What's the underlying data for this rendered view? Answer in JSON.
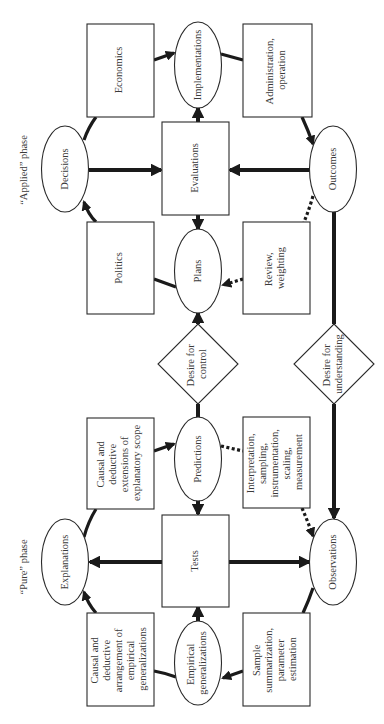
{
  "diagram": {
    "orientation": "rotated 90 degrees counter-clockwise",
    "phases": {
      "applied": "“Applied” phase",
      "pure": "“Pure” phase"
    },
    "nodes": {
      "decisions": {
        "shape": "ellipse",
        "lines": [
          "Decisions"
        ]
      },
      "economics": {
        "shape": "rect",
        "lines": [
          "Economics"
        ]
      },
      "implementations": {
        "shape": "ellipse",
        "lines": [
          "Implementations"
        ]
      },
      "administration": {
        "shape": "rect",
        "lines": [
          "Administration,",
          "operation"
        ]
      },
      "evaluations": {
        "shape": "rect",
        "lines": [
          "Evaluations"
        ]
      },
      "outcomes": {
        "shape": "ellipse",
        "lines": [
          "Outcomes"
        ]
      },
      "politics": {
        "shape": "rect",
        "lines": [
          "Politics"
        ]
      },
      "plans": {
        "shape": "ellipse",
        "lines": [
          "Plans"
        ]
      },
      "review": {
        "shape": "rect",
        "lines": [
          "Review,",
          "weighting"
        ]
      },
      "desire_control": {
        "shape": "diamond",
        "lines": [
          "Desire for",
          "control"
        ]
      },
      "desire_understanding": {
        "shape": "diamond",
        "lines": [
          "Desire for",
          "understanding"
        ]
      },
      "extensions": {
        "shape": "rect",
        "lines": [
          "Causal and",
          "deductive",
          "extensions of",
          "explanatory scope"
        ]
      },
      "predictions": {
        "shape": "ellipse",
        "lines": [
          "Predictions"
        ]
      },
      "interpretation": {
        "shape": "rect",
        "lines": [
          "Interpretation,",
          "sampling,",
          "instrumentation,",
          "scaling,",
          "measurement"
        ]
      },
      "explanations": {
        "shape": "ellipse",
        "lines": [
          "Explanations"
        ]
      },
      "tests": {
        "shape": "rect",
        "lines": [
          "Tests"
        ]
      },
      "observations": {
        "shape": "ellipse",
        "lines": [
          "Observations"
        ]
      },
      "arrangement": {
        "shape": "rect",
        "lines": [
          "Causal and",
          "deductive",
          "arrangement of",
          "empirical",
          "generalizations"
        ]
      },
      "empirical": {
        "shape": "ellipse",
        "lines": [
          "Empirical",
          "generalizations"
        ]
      },
      "sample": {
        "shape": "rect",
        "lines": [
          "Sample",
          "summarization,",
          "parameter",
          "estimation"
        ]
      }
    },
    "edges": [
      {
        "from": "politics",
        "to": "decisions",
        "style": "solid"
      },
      {
        "from": "decisions",
        "to": "economics",
        "style": "solid"
      },
      {
        "from": "economics",
        "to": "implementations",
        "style": "solid"
      },
      {
        "from": "implementations",
        "to": "administration",
        "style": "solid"
      },
      {
        "from": "administration",
        "to": "outcomes",
        "style": "solid"
      },
      {
        "from": "decisions",
        "to": "evaluations",
        "style": "solid"
      },
      {
        "from": "outcomes",
        "to": "evaluations",
        "style": "solid"
      },
      {
        "from": "evaluations",
        "to": "implementations",
        "style": "solid"
      },
      {
        "from": "evaluations",
        "to": "plans",
        "style": "solid"
      },
      {
        "from": "plans",
        "to": "politics",
        "style": "solid"
      },
      {
        "from": "outcomes",
        "to": "review",
        "style": "dashed"
      },
      {
        "from": "review",
        "to": "plans",
        "style": "dashed"
      },
      {
        "from": "desire_control",
        "to": "plans",
        "style": "solid"
      },
      {
        "from": "desire_control",
        "to": "predictions",
        "style": "solid"
      },
      {
        "from": "outcomes",
        "to": "desire_understanding",
        "style": "solid"
      },
      {
        "from": "desire_understanding",
        "to": "observations",
        "style": "solid"
      },
      {
        "from": "extensions",
        "to": "predictions",
        "style": "solid"
      },
      {
        "from": "explanations",
        "to": "extensions",
        "style": "solid"
      },
      {
        "from": "predictions",
        "to": "interpretation",
        "style": "dashed"
      },
      {
        "from": "interpretation",
        "to": "observations",
        "style": "dashed"
      },
      {
        "from": "predictions",
        "to": "tests",
        "style": "solid"
      },
      {
        "from": "tests",
        "to": "explanations",
        "style": "solid"
      },
      {
        "from": "tests",
        "to": "observations",
        "style": "solid"
      },
      {
        "from": "observations",
        "to": "sample",
        "style": "solid"
      },
      {
        "from": "sample",
        "to": "empirical",
        "style": "solid"
      },
      {
        "from": "empirical",
        "to": "arrangement",
        "style": "solid"
      },
      {
        "from": "arrangement",
        "to": "explanations",
        "style": "solid"
      },
      {
        "from": "empirical",
        "to": "tests",
        "style": "solid"
      }
    ]
  }
}
